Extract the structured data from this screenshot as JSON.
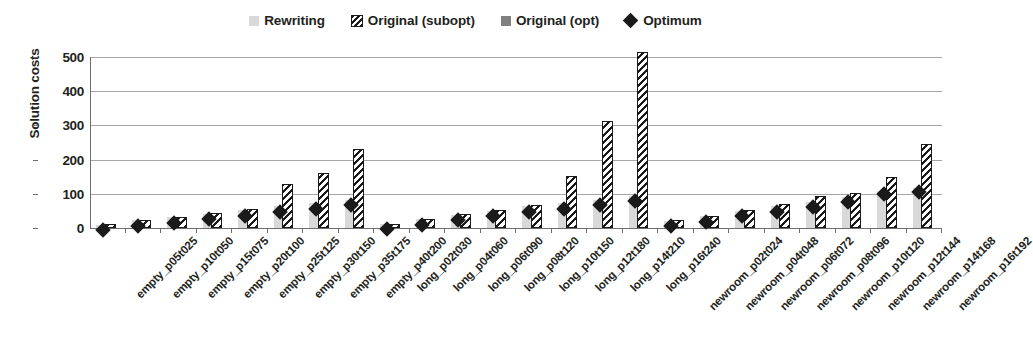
{
  "chart_data": {
    "type": "bar",
    "title": "",
    "xlabel": "",
    "ylabel": "Solution costs",
    "ylim": [
      0,
      500
    ],
    "yticks": [
      0,
      100,
      200,
      300,
      400,
      500
    ],
    "grid": true,
    "legend_position": "top-center",
    "legend": [
      {
        "name": "Rewriting",
        "marker": "light-gray-square",
        "color": "#d9d9d9"
      },
      {
        "name": "Original (subopt)",
        "marker": "diagonal-hatched-square",
        "color": "#ffffff"
      },
      {
        "name": "Original (opt)",
        "marker": "dark-gray-square",
        "color": "#808080"
      },
      {
        "name": "Optimum",
        "marker": "black-diamond",
        "color": "#1a1a1a"
      }
    ],
    "categories": [
      "empty_p05t025",
      "empty_p10t050",
      "empty_p15t075",
      "empty_p20t100",
      "empty_p25t125",
      "empty_p30t150",
      "empty_p35t175",
      "empty_p40t200",
      "long_p02t030",
      "long_p04t060",
      "long_p06t090",
      "long_p08t120",
      "long_p10t150",
      "long_p12t180",
      "long_p14t210",
      "long_p16t240",
      "newroom_p02t024",
      "newroom_p04t048",
      "newroom_p06t072",
      "newroom_p08t096",
      "newroom_p10t120",
      "newroom_p12t144",
      "newroom_p14t168",
      "newroom_p16t192"
    ],
    "series": [
      {
        "name": "Rewriting",
        "values": [
          10,
          22,
          31,
          42,
          52,
          64,
          74,
          82,
          0,
          0,
          0,
          0,
          0,
          0,
          0,
          0,
          0,
          0,
          0,
          0,
          0,
          0,
          0,
          0
        ]
      },
      {
        "name": "Original (subopt)",
        "values": [
          0,
          0,
          30,
          43,
          55,
          130,
          160,
          230,
          0,
          0,
          0,
          0,
          0,
          0,
          0,
          0,
          0,
          0,
          0,
          0,
          0,
          0,
          0,
          0
        ]
      },
      {
        "name": "Original (opt)",
        "values": [
          0,
          0,
          0,
          0,
          0,
          0,
          0,
          0,
          0,
          0,
          0,
          0,
          0,
          0,
          0,
          0,
          0,
          0,
          0,
          0,
          0,
          0,
          0,
          0
        ]
      },
      {
        "name": "Optimum",
        "values": [
          10,
          21,
          30,
          41,
          52,
          63,
          73,
          82,
          13,
          26,
          39,
          51,
          63,
          72,
          82,
          95,
          22,
          35,
          50,
          64,
          78,
          92,
          115,
          122
        ]
      }
    ],
    "bars": [
      {
        "category": "empty_p05t025",
        "rewriting": 10,
        "subopt": 11,
        "optimum": 10
      },
      {
        "category": "empty_p10t050",
        "rewriting": 22,
        "subopt": 22,
        "optimum": 21
      },
      {
        "category": "empty_p15t075",
        "rewriting": 31,
        "subopt": 32,
        "optimum": 30
      },
      {
        "category": "empty_p20t100",
        "rewriting": 42,
        "subopt": 44,
        "optimum": 41
      },
      {
        "category": "empty_p25t125",
        "rewriting": 52,
        "subopt": 57,
        "optimum": 52
      },
      {
        "category": "empty_p30t150",
        "rewriting": 64,
        "subopt": 130,
        "optimum": 63
      },
      {
        "category": "empty_p35t175",
        "rewriting": 74,
        "subopt": 160,
        "optimum": 73
      },
      {
        "category": "empty_p40t200",
        "rewriting": 82,
        "subopt": 230,
        "optimum": 82
      },
      {
        "category": "long_p02t030",
        "rewriting": 13,
        "subopt": 13,
        "optimum": 13
      },
      {
        "category": "long_p04t060",
        "rewriting": 26,
        "subopt": 27,
        "optimum": 26
      },
      {
        "category": "long_p06t090",
        "rewriting": 39,
        "subopt": 40,
        "optimum": 39
      },
      {
        "category": "long_p08t120",
        "rewriting": 51,
        "subopt": 53,
        "optimum": 51
      },
      {
        "category": "long_p10t150",
        "rewriting": 63,
        "subopt": 66,
        "optimum": 63
      },
      {
        "category": "long_p12t180",
        "rewriting": 72,
        "subopt": 151,
        "optimum": 72
      },
      {
        "category": "long_p14t210",
        "rewriting": 82,
        "subopt": 313,
        "optimum": 82
      },
      {
        "category": "long_p16t240",
        "rewriting": 95,
        "subopt": 515,
        "optimum": 95
      },
      {
        "category": "newroom_p02t024",
        "rewriting": 21,
        "subopt": 22,
        "optimum": 22
      },
      {
        "category": "newroom_p04t048",
        "rewriting": 34,
        "subopt": 35,
        "optimum": 35
      },
      {
        "category": "newroom_p06t072",
        "rewriting": 49,
        "subopt": 52,
        "optimum": 50
      },
      {
        "category": "newroom_p08t096",
        "rewriting": 63,
        "subopt": 70,
        "optimum": 64
      },
      {
        "category": "newroom_p10t120",
        "rewriting": 77,
        "subopt": 95,
        "optimum": 78
      },
      {
        "category": "newroom_p12t144",
        "rewriting": 91,
        "subopt": 101,
        "optimum": 92
      },
      {
        "category": "newroom_p14t168",
        "rewriting": 108,
        "subopt": 148,
        "optimum": 115
      },
      {
        "category": "newroom_p16t192",
        "rewriting": 118,
        "subopt": 245,
        "optimum": 122
      }
    ]
  },
  "legend": {
    "items": [
      {
        "label": "Rewriting",
        "swatch": "light-gray-square"
      },
      {
        "label": "Original (subopt)",
        "swatch": "hatched-square"
      },
      {
        "label": "Original (opt)",
        "swatch": "dark-gray-square"
      },
      {
        "label": "Optimum",
        "swatch": "black-diamond"
      }
    ]
  },
  "axes": {
    "y_title": "Solution costs",
    "y_ticks": [
      "500",
      "400",
      "300",
      "200",
      "100",
      "0"
    ]
  },
  "colors": {
    "rewriting": "#d9d9d9",
    "subopt_fill": "#ffffff",
    "subopt_hatch": "#1a1a1a",
    "opt": "#808080",
    "optimum": "#1a1a1a",
    "grid": "#a6a6a6",
    "axis": "#6e6e6e",
    "text": "#231f20"
  }
}
